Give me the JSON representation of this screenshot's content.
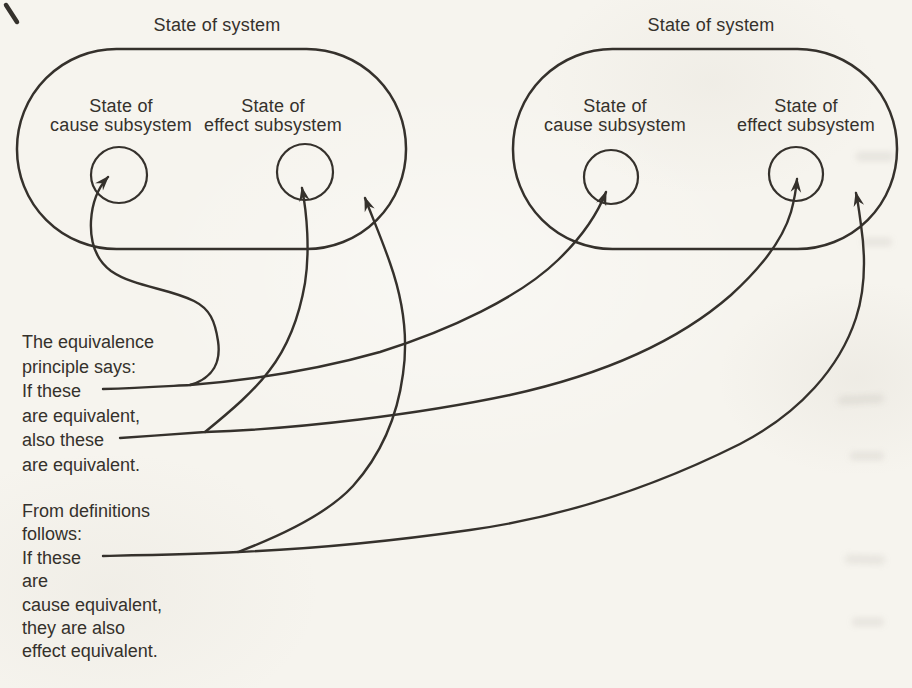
{
  "page": {
    "background_color": "#f6f4ee",
    "ink_color": "#35312c"
  },
  "systems": {
    "left": {
      "title": "State of system",
      "cause": [
        "State of",
        "cause subsystem"
      ],
      "effect": [
        "State of",
        "effect subsystem"
      ]
    },
    "right": {
      "title": "State of system",
      "cause": [
        "State of",
        "cause subsystem"
      ],
      "effect": [
        "State of",
        "effect subsystem"
      ]
    }
  },
  "notes": {
    "equivalence": {
      "lines": [
        "The equivalence",
        "principle says:",
        "If these",
        "are equivalent,",
        "also these",
        "are equivalent."
      ]
    },
    "definitions": {
      "lines": [
        "From definitions",
        "follows:",
        "If these",
        "are",
        "cause equivalent,",
        "they are also",
        "effect equivalent."
      ]
    }
  },
  "edges": [
    {
      "from": "equivalence note — If these",
      "to": "left system — state of cause subsystem circle"
    },
    {
      "from": "equivalence note — If these",
      "to": "right system — state of cause subsystem circle"
    },
    {
      "from": "equivalence note — also these",
      "to": "left system — state of effect subsystem circle"
    },
    {
      "from": "equivalence note — also these",
      "to": "right system — state of effect subsystem circle"
    },
    {
      "from": "definitions note — If these",
      "to": "left system — state of system region"
    },
    {
      "from": "definitions note — If these",
      "to": "right system — state of system region"
    }
  ]
}
